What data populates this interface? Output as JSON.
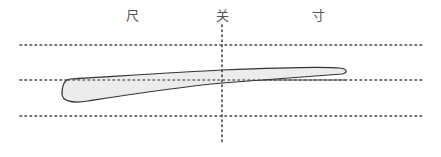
{
  "diagram": {
    "title": "",
    "positions": [
      {
        "label": "尺",
        "x": 132
      },
      {
        "label": "关",
        "x": 222
      },
      {
        "label": "寸",
        "x": 318
      }
    ],
    "horizontal_guides": [
      {
        "name": "upper",
        "y": 45
      },
      {
        "name": "middle",
        "y": 80
      },
      {
        "name": "lower",
        "y": 116
      }
    ],
    "vertical_guide": {
      "x": 222,
      "y_start": 25,
      "y_end": 145
    },
    "pulse_shape": {
      "description": "elongated pulse form, thick at chi (尺), tapering toward cun (寸)",
      "fill": "#ececec",
      "stroke": "#333333"
    },
    "guide_color": "#444444"
  }
}
